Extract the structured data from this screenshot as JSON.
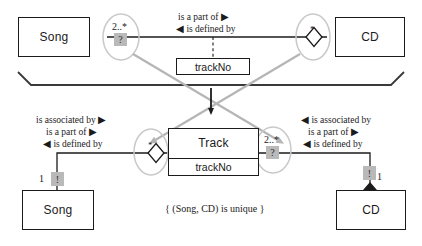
{
  "diagram": {
    "colors": {
      "ink": "#1b1b1b",
      "gray_arrow": "#b5b5b5",
      "chip": "#b9b9b9"
    },
    "top": {
      "left_class": "Song",
      "right_class": "CD",
      "association_class": "trackNo",
      "left_multiplicity": "2..*",
      "left_chip": "?",
      "right_multiplicity": "*",
      "role_forward": "is a part of ▶",
      "role_backward": "◀ is defined by"
    },
    "bottom": {
      "center_class": "Track",
      "center_attribute": "trackNo",
      "left_class": "Song",
      "right_class": "CD",
      "left_multiplicity": "*",
      "left_end_multiplicity": "1",
      "left_chip": "!",
      "right_multiplicity": "2..*",
      "right_chip": "?",
      "right_end_multiplicity": "1",
      "right_end_chip": "!",
      "left_roles": [
        "is associated by ▶",
        "is a part of ▶",
        "◀ is defined by"
      ],
      "right_roles": [
        "◀ is associated by",
        "is a part of ▶",
        "◀ is defined by"
      ],
      "constraint": "{ (Song, CD) is unique }"
    }
  }
}
